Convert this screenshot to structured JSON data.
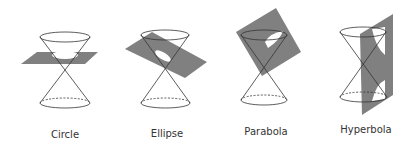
{
  "diagram": {
    "colors": {
      "plane": "#808080",
      "cone_line": "#333333",
      "background": "#ffffff",
      "section": "#ffffff"
    },
    "sections": [
      {
        "id": "circle",
        "label": "Circle",
        "label_x": 65,
        "label_y": 129
      },
      {
        "id": "ellipse",
        "label": "Ellipse",
        "label_x": 167,
        "label_y": 128
      },
      {
        "id": "parabola",
        "label": "Parabola",
        "label_x": 266,
        "label_y": 126
      },
      {
        "id": "hyperbola",
        "label": "Hyperbola",
        "label_x": 366,
        "label_y": 124
      }
    ]
  }
}
